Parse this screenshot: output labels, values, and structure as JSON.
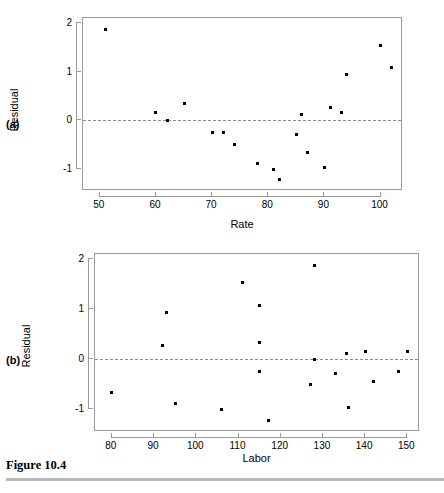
{
  "figure": {
    "caption": "Figure 10.4",
    "panels": [
      {
        "tag": "(a)"
      },
      {
        "tag": "(b)"
      }
    ]
  },
  "chart_data": [
    {
      "type": "scatter",
      "panel": "(a)",
      "title": "",
      "xlabel": "Rate",
      "ylabel": "Residual",
      "xlim": [
        47,
        104
      ],
      "ylim": [
        -1.45,
        2.1
      ],
      "xticks": [
        50,
        60,
        70,
        80,
        90,
        100
      ],
      "yticks": [
        -1,
        0,
        1,
        2
      ],
      "grid": false,
      "legend": "none",
      "reference_line": {
        "y": 0,
        "style": "dashed"
      },
      "x": [
        51,
        60,
        62,
        65,
        70,
        72,
        74,
        78,
        81,
        82,
        85,
        86,
        87,
        90,
        91,
        93,
        94,
        100,
        102
      ],
      "y": [
        1.87,
        0.16,
        0.0,
        0.34,
        -0.25,
        -0.24,
        -0.5,
        -0.88,
        -1.0,
        -1.22,
        -0.29,
        0.11,
        -0.65,
        -0.96,
        0.27,
        0.16,
        0.94,
        1.54,
        1.08
      ]
    },
    {
      "type": "scatter",
      "panel": "(b)",
      "title": "",
      "xlabel": "Labor",
      "ylabel": "Residual",
      "xlim": [
        76,
        153
      ],
      "ylim": [
        -1.45,
        2.1
      ],
      "xticks": [
        80,
        90,
        100,
        110,
        120,
        130,
        140,
        150
      ],
      "yticks": [
        -1,
        0,
        1,
        2
      ],
      "grid": false,
      "legend": "none",
      "reference_line": {
        "y": 0,
        "style": "dashed"
      },
      "x": [
        80,
        92,
        93,
        95,
        106,
        111,
        115,
        115,
        115,
        117,
        127,
        128,
        128,
        133,
        135.5,
        136,
        140,
        142,
        148,
        150
      ],
      "y": [
        -0.67,
        0.27,
        0.94,
        -0.89,
        -1.01,
        1.54,
        1.08,
        0.34,
        -0.25,
        -1.22,
        -0.5,
        1.87,
        0.0,
        -0.29,
        0.11,
        -0.96,
        0.16,
        -0.45,
        -0.24,
        0.16
      ]
    }
  ]
}
